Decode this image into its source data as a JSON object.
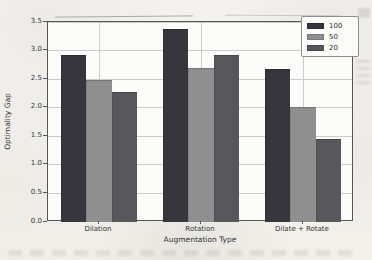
{
  "figure": {
    "background_color": "#f3f1ec",
    "plot_background_color": "#fcfcfa",
    "grid_color": "#cbcbc7",
    "spine_color": "#55555a",
    "text_color": "#333336"
  },
  "chart_data": {
    "type": "bar",
    "title": "",
    "xlabel": "Augmentation Type",
    "ylabel": "Optimality Gap",
    "categories": [
      "Dilation",
      "Rotation",
      "Dilate + Rotate"
    ],
    "series": [
      {
        "name": "100",
        "color": "#36363c",
        "values": [
          2.93,
          3.37,
          2.67
        ]
      },
      {
        "name": "50",
        "color": "#8f8f90",
        "values": [
          2.49,
          2.69,
          2.02
        ]
      },
      {
        "name": "20",
        "color": "#58585c",
        "values": [
          2.28,
          2.92,
          1.46
        ]
      }
    ],
    "ylim": [
      0.0,
      3.5
    ],
    "ytick_labels": [
      "0.0",
      "0.5",
      "1.0",
      "1.5",
      "2.0",
      "2.5",
      "3.0",
      "3.5"
    ],
    "grid": true,
    "legend_position": "upper right",
    "bar_width_fraction": 0.25
  }
}
